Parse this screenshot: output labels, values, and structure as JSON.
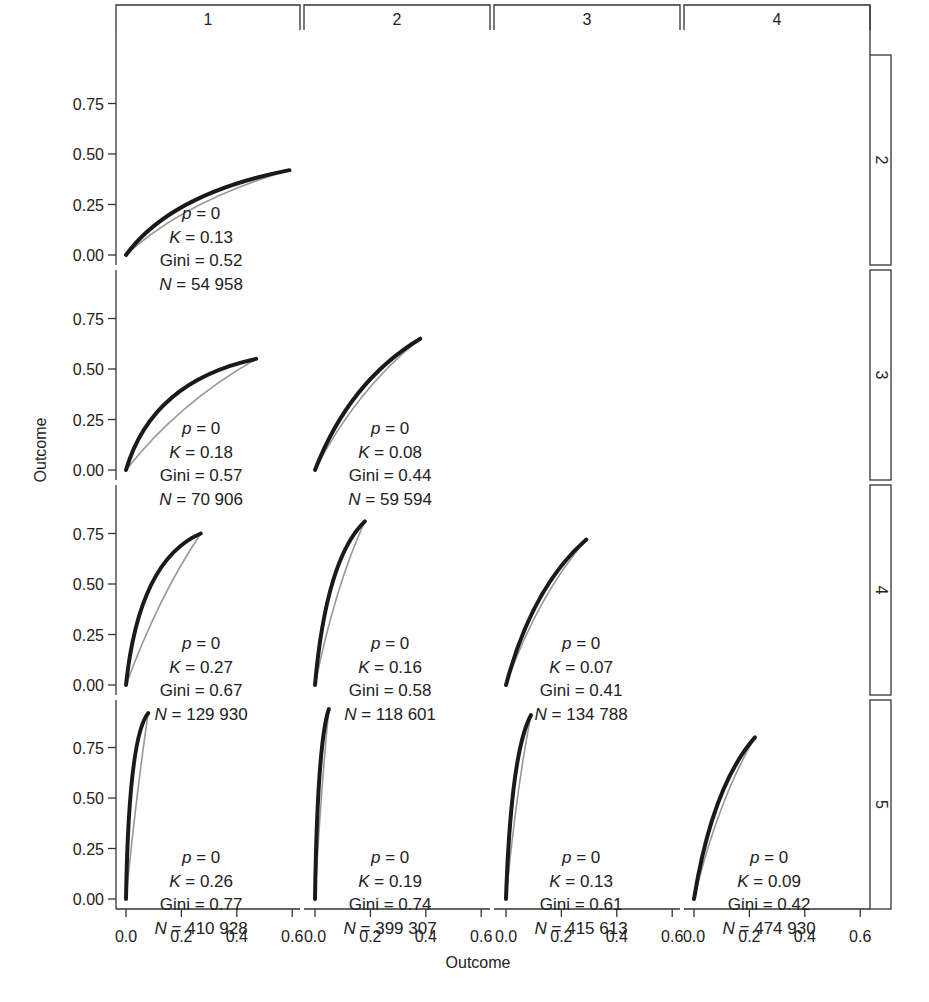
{
  "chart_data": {
    "type": "line",
    "title": "",
    "xlabel": "Outcome",
    "ylabel": "Outcome",
    "xlim": [
      0,
      0.65
    ],
    "ylim": [
      0,
      0.95
    ],
    "x_ticks": [
      "0.0",
      "0.2",
      "0.4",
      "0.6"
    ],
    "x_tick_values": [
      0,
      0.2,
      0.4,
      0.6
    ],
    "y_ticks": [
      "0.00",
      "0.25",
      "0.50",
      "0.75"
    ],
    "y_tick_values": [
      0,
      0.25,
      0.5,
      0.75
    ],
    "grid": false,
    "legend": null,
    "column_strips": [
      "1",
      "2",
      "3",
      "4"
    ],
    "row_strips": [
      "2",
      "3",
      "4",
      "5"
    ],
    "series_styles": [
      {
        "name": "observed",
        "color": "#1a1a1a",
        "width": 4
      },
      {
        "name": "reference",
        "color": "#999999",
        "width": 1.6
      }
    ],
    "panels": [
      {
        "row": 0,
        "col": 0,
        "p": "0",
        "K": "0.13",
        "Gini": "0.52",
        "N": "54 958",
        "x_end": 0.59,
        "y_end": 0.42,
        "curv": 0.45,
        "ref_curv": 0.28
      },
      {
        "row": 1,
        "col": 0,
        "p": "0",
        "K": "0.18",
        "Gini": "0.57",
        "N": "70 906",
        "x_end": 0.47,
        "y_end": 0.55,
        "curv": 0.6,
        "ref_curv": 0.2
      },
      {
        "row": 1,
        "col": 1,
        "p": "0",
        "K": "0.08",
        "Gini": "0.44",
        "N": "59 594",
        "x_end": 0.38,
        "y_end": 0.65,
        "curv": 0.35,
        "ref_curv": 0.22
      },
      {
        "row": 2,
        "col": 0,
        "p": "0",
        "K": "0.27",
        "Gini": "0.67",
        "N": "129 930",
        "x_end": 0.27,
        "y_end": 0.75,
        "curv": 0.65,
        "ref_curv": 0.15
      },
      {
        "row": 2,
        "col": 1,
        "p": "0",
        "K": "0.16",
        "Gini": "0.58",
        "N": "118 601",
        "x_end": 0.18,
        "y_end": 0.81,
        "curv": 0.55,
        "ref_curv": 0.2
      },
      {
        "row": 2,
        "col": 2,
        "p": "0",
        "K": "0.07",
        "Gini": "0.41",
        "N": "134 788",
        "x_end": 0.29,
        "y_end": 0.72,
        "curv": 0.35,
        "ref_curv": 0.22
      },
      {
        "row": 3,
        "col": 0,
        "p": "0",
        "K": "0.26",
        "Gini": "0.77",
        "N": "410 928",
        "x_end": 0.08,
        "y_end": 0.92,
        "curv": 0.75,
        "ref_curv": 0.1
      },
      {
        "row": 3,
        "col": 1,
        "p": "0",
        "K": "0.19",
        "Gini": "0.74",
        "N": "399 307",
        "x_end": 0.05,
        "y_end": 0.94,
        "curv": 0.65,
        "ref_curv": 0.15
      },
      {
        "row": 3,
        "col": 2,
        "p": "0",
        "K": "0.13",
        "Gini": "0.61",
        "N": "415 613",
        "x_end": 0.09,
        "y_end": 0.91,
        "curv": 0.6,
        "ref_curv": 0.18
      },
      {
        "row": 3,
        "col": 3,
        "p": "0",
        "K": "0.09",
        "Gini": "0.42",
        "N": "474 930",
        "x_end": 0.22,
        "y_end": 0.8,
        "curv": 0.4,
        "ref_curv": 0.22
      }
    ]
  },
  "labels": {
    "x_axis_title": "Outcome",
    "y_axis_title": "Outcome",
    "annot_p": "p",
    "annot_K": "K",
    "annot_gini": "Gini",
    "annot_N": "N",
    "equals": " = "
  }
}
